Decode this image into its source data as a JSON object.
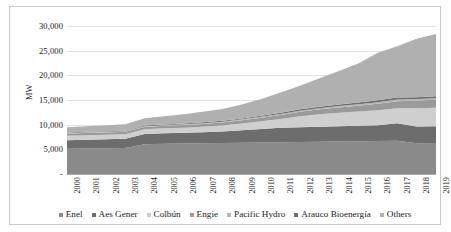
{
  "chart_data": {
    "type": "area",
    "title": "",
    "xlabel": "",
    "ylabel": "MW",
    "ylim": [
      0,
      30000
    ],
    "ytick_labels": [
      "30,000",
      "25,000",
      "20,000",
      "15,000",
      "10,000",
      "5,000",
      "-"
    ],
    "ytick_values": [
      30000,
      25000,
      20000,
      15000,
      10000,
      5000,
      0
    ],
    "grid": true,
    "stacked": true,
    "legend_position": "bottom",
    "categories": [
      "2000",
      "2001",
      "2002",
      "2003",
      "2004",
      "2005",
      "2006",
      "2007",
      "2008",
      "2009",
      "2010",
      "2011",
      "2012",
      "2013",
      "2014",
      "2015",
      "2016",
      "2017",
      "2018",
      "2019"
    ],
    "series": [
      {
        "name": "Enel",
        "color": "#8a8a8a",
        "values": [
          5100,
          5150,
          5200,
          5250,
          6050,
          6150,
          6200,
          6250,
          6300,
          6350,
          6400,
          6450,
          6500,
          6550,
          6600,
          6650,
          6700,
          6750,
          6250,
          6300
        ]
      },
      {
        "name": "Aes Gener",
        "color": "#6d6d6d",
        "values": [
          1750,
          1800,
          1850,
          1900,
          2050,
          2100,
          2150,
          2200,
          2300,
          2500,
          2700,
          2900,
          3000,
          3050,
          3100,
          3150,
          3200,
          3550,
          3400,
          3400
        ]
      },
      {
        "name": "Colbún",
        "color": "#cfcfcf",
        "values": [
          900,
          900,
          900,
          900,
          950,
          1000,
          1050,
          1150,
          1250,
          1400,
          1600,
          1800,
          2200,
          2500,
          2700,
          2850,
          3000,
          3050,
          3700,
          3750
        ]
      },
      {
        "name": "Engie",
        "color": "#9a9a9a",
        "values": [
          450,
          470,
          480,
          490,
          500,
          520,
          540,
          560,
          600,
          650,
          700,
          800,
          900,
          1000,
          1100,
          1200,
          1350,
          1400,
          1550,
          1600
        ]
      },
      {
        "name": "Pacific Hydro",
        "color": "#b5b5b5",
        "values": [
          120,
          120,
          120,
          125,
          130,
          135,
          140,
          150,
          160,
          175,
          190,
          210,
          230,
          250,
          270,
          290,
          310,
          330,
          280,
          290
        ]
      },
      {
        "name": "Arauco Bioenergía",
        "color": "#6f6f6f",
        "values": [
          110,
          115,
          120,
          125,
          130,
          140,
          150,
          165,
          180,
          200,
          220,
          245,
          270,
          300,
          330,
          360,
          390,
          420,
          400,
          410
        ]
      },
      {
        "name": "Others",
        "color": "#b0b0b0",
        "values": [
          1070,
          1145,
          1230,
          1310,
          1490,
          1655,
          1870,
          2125,
          2410,
          2825,
          3390,
          4095,
          4800,
          5750,
          6800,
          7900,
          9650,
          10400,
          11820,
          12650
        ]
      }
    ]
  },
  "legend": {
    "items": [
      {
        "label": "Enel"
      },
      {
        "label": "Aes Gener"
      },
      {
        "label": "Colbún"
      },
      {
        "label": "Engie"
      },
      {
        "label": "Pacific Hydro"
      },
      {
        "label": "Arauco Bioenergía"
      },
      {
        "label": "Others"
      }
    ]
  }
}
